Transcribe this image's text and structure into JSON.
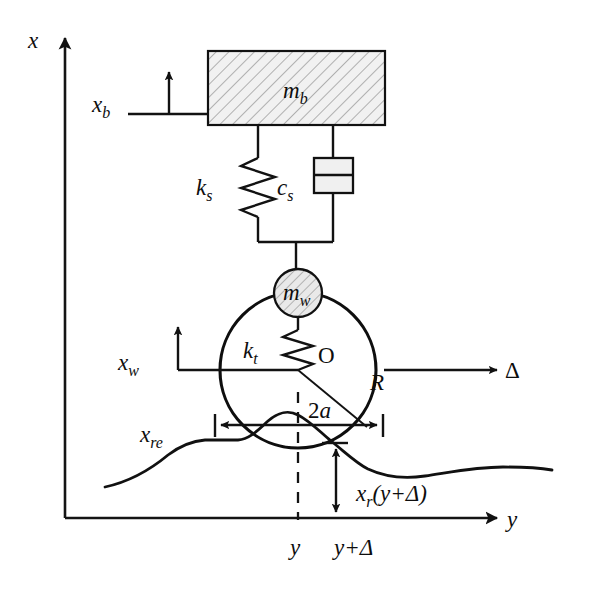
{
  "figure": {
    "background_color": "#ffffff",
    "line_color": "#111111",
    "hatch_fill_color": "#efefef"
  },
  "axes": {
    "vertical": {
      "label": "x",
      "name": "x-axis-vertical"
    },
    "horizontal": {
      "label": "y",
      "name": "y-axis-horizontal"
    }
  },
  "labels": {
    "body_mass": {
      "base": "m",
      "sub": "b"
    },
    "wheel_mass": {
      "base": "m",
      "sub": "w"
    },
    "suspension_spring": {
      "base": "k",
      "sub": "s"
    },
    "suspension_damper": {
      "base": "c",
      "sub": "s"
    },
    "tire_spring": {
      "base": "k",
      "sub": "t"
    },
    "body_displacement": {
      "base": "x",
      "sub": "b"
    },
    "wheel_displacement": {
      "base": "x",
      "sub": "w"
    },
    "road_envelope": {
      "base": "x",
      "sub": "re"
    },
    "wheel_center": "O",
    "wheel_radius": "R",
    "contact_patch": {
      "base": "2",
      "sub_italic": "a"
    },
    "road_shift": "Δ",
    "road_height": {
      "base": "x",
      "sub": "r",
      "arg": "(y+Δ)"
    },
    "tick_y": "y",
    "tick_y_delta": "y+Δ"
  },
  "geometry": {
    "body_block": {
      "x": 208,
      "y": 51,
      "width": 177,
      "height": 74
    },
    "wheel": {
      "cx": 298,
      "cy": 370,
      "r": 78
    },
    "wheel_mass_circle": {
      "cx": 298,
      "cy": 293,
      "r": 24
    },
    "damper_box": {
      "x": 314,
      "y": 158,
      "width": 39,
      "height": 35
    },
    "contact_patch_span": {
      "x_left": 215,
      "x_right": 383,
      "y": 425
    },
    "road_height_arrow": {
      "x": 336,
      "y_top": 443,
      "y_bottom": 518
    },
    "dashed_center_line": {
      "x": 298,
      "y_top": 392,
      "y_bottom": 520
    }
  }
}
